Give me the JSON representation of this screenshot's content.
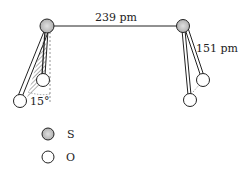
{
  "diagram": {
    "bond_ss_label": "239 pm",
    "bond_so_label": "151 pm",
    "angle_label": "15°",
    "legend": [
      {
        "atom": "S",
        "label": "S",
        "fill": "#c8c8c8"
      },
      {
        "atom": "O",
        "label": "O",
        "fill": "#ffffff"
      }
    ],
    "colors": {
      "stroke": "#222222",
      "sulfur_fill": "#c8c8c8",
      "oxygen_fill": "#ffffff"
    }
  }
}
